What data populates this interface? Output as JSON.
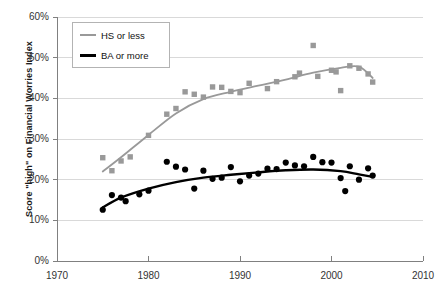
{
  "chart": {
    "title": "",
    "y_axis_title": "Score \"high\" on Financial Worries Index",
    "y_ticks": [
      "0%",
      "10%",
      "20%",
      "30%",
      "40%",
      "50%",
      "60%"
    ],
    "x_ticks": [
      "1970",
      "1980",
      "1990",
      "2000",
      "2010"
    ],
    "legend": {
      "items": [
        {
          "label": "HS or less",
          "color": "#999999"
        },
        {
          "label": "BA or more",
          "color": "#000000"
        }
      ]
    }
  },
  "chart_data": {
    "type": "scatter",
    "title": "",
    "xlabel": "",
    "ylabel": "Score \"high\" on Financial Worries Index",
    "xlim": [
      1970,
      2010
    ],
    "ylim": [
      0,
      60
    ],
    "xticks": [
      1970,
      1980,
      1990,
      2000,
      2010
    ],
    "yticks": [
      0,
      10,
      20,
      30,
      40,
      50,
      60
    ],
    "grid": "horizontal",
    "legend_position": "top-left",
    "value_unit": "percent",
    "series": [
      {
        "name": "HS or less",
        "color": "#999999",
        "marker": "square",
        "points": [
          [
            1975,
            25.4
          ],
          [
            1976,
            22.2
          ],
          [
            1977,
            24.6
          ],
          [
            1978,
            25.6
          ],
          [
            1980,
            30.9
          ],
          [
            1982,
            36.1
          ],
          [
            1983,
            37.5
          ],
          [
            1984,
            41.6
          ],
          [
            1985,
            41.0
          ],
          [
            1986,
            40.3
          ],
          [
            1987,
            42.8
          ],
          [
            1988,
            42.7
          ],
          [
            1989,
            41.7
          ],
          [
            1990,
            41.4
          ],
          [
            1991,
            43.7
          ],
          [
            1993,
            42.4
          ],
          [
            1994,
            44.1
          ],
          [
            1996,
            45.3
          ],
          [
            1996.5,
            46.2
          ],
          [
            1998,
            53.0
          ],
          [
            1998.5,
            45.4
          ],
          [
            2000,
            46.9
          ],
          [
            2000.5,
            46.5
          ],
          [
            2001,
            41.9
          ],
          [
            2002,
            48.0
          ],
          [
            2003,
            47.4
          ],
          [
            2004,
            46.0
          ],
          [
            2004.5,
            44.0
          ]
        ],
        "trend": [
          [
            1975,
            22.0
          ],
          [
            1977,
            25.5
          ],
          [
            1980,
            31.0
          ],
          [
            1983,
            36.3
          ],
          [
            1986,
            39.8
          ],
          [
            1989,
            41.6
          ],
          [
            1992,
            43.1
          ],
          [
            1995,
            44.6
          ],
          [
            1998,
            46.3
          ],
          [
            2001,
            47.5
          ],
          [
            2003,
            47.8
          ],
          [
            2004.5,
            45.0
          ]
        ]
      },
      {
        "name": "BA or more",
        "color": "#000000",
        "marker": "circle",
        "points": [
          [
            1975,
            12.6
          ],
          [
            1976,
            16.2
          ],
          [
            1977,
            15.6
          ],
          [
            1977.5,
            14.7
          ],
          [
            1979,
            16.4
          ],
          [
            1980,
            17.3
          ],
          [
            1982,
            24.4
          ],
          [
            1983,
            23.2
          ],
          [
            1984,
            22.5
          ],
          [
            1985,
            17.8
          ],
          [
            1986,
            22.2
          ],
          [
            1987,
            20.2
          ],
          [
            1988,
            20.5
          ],
          [
            1989,
            23.1
          ],
          [
            1990,
            19.6
          ],
          [
            1991,
            21.0
          ],
          [
            1992,
            21.5
          ],
          [
            1993,
            22.7
          ],
          [
            1994,
            22.6
          ],
          [
            1995,
            24.2
          ],
          [
            1996,
            23.5
          ],
          [
            1997,
            23.3
          ],
          [
            1998,
            25.6
          ],
          [
            1999,
            24.3
          ],
          [
            2000,
            24.2
          ],
          [
            2001,
            20.4
          ],
          [
            2001.5,
            17.2
          ],
          [
            2002,
            23.3
          ],
          [
            2003,
            20.0
          ],
          [
            2004,
            22.8
          ],
          [
            2004.5,
            21.0
          ]
        ],
        "trend": [
          [
            1975,
            13.2
          ],
          [
            1977,
            15.6
          ],
          [
            1980,
            17.8
          ],
          [
            1983,
            19.4
          ],
          [
            1986,
            20.5
          ],
          [
            1989,
            21.2
          ],
          [
            1992,
            21.8
          ],
          [
            1995,
            22.3
          ],
          [
            1998,
            22.5
          ],
          [
            2001,
            22.1
          ],
          [
            2003,
            21.3
          ],
          [
            2004.5,
            20.7
          ]
        ]
      }
    ]
  }
}
